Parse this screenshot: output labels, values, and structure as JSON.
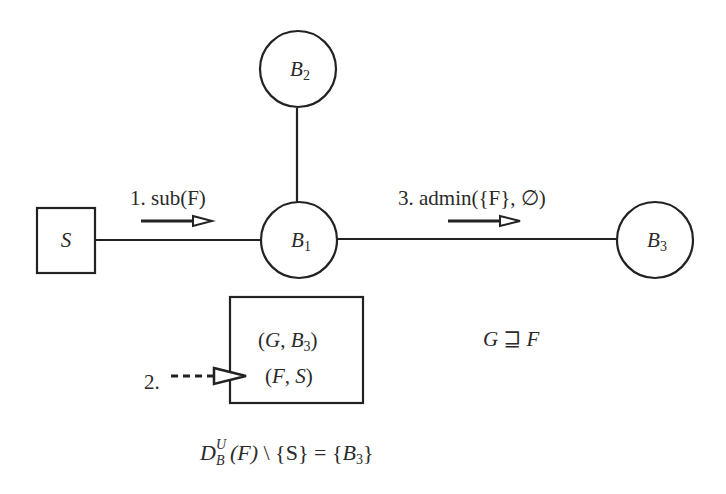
{
  "diagram": {
    "type": "network-message-flow",
    "nodes": [
      {
        "id": "S",
        "shape": "square",
        "label": "S",
        "center": [
          66,
          240
        ]
      },
      {
        "id": "B1",
        "shape": "circle",
        "label": "B",
        "subscript": "1",
        "center": [
          299,
          240
        ]
      },
      {
        "id": "B2",
        "shape": "circle",
        "label": "B",
        "subscript": "2",
        "center": [
          299,
          69
        ]
      },
      {
        "id": "B3",
        "shape": "circle",
        "label": "B",
        "subscript": "3",
        "center": [
          655,
          240
        ]
      }
    ],
    "edges": [
      {
        "from": "S",
        "to": "B1"
      },
      {
        "from": "B2",
        "to": "B1"
      },
      {
        "from": "B1",
        "to": "B3"
      }
    ],
    "messages": [
      {
        "step": "1.",
        "text": "sub(F)",
        "direction": "S→B1"
      },
      {
        "step": "2.",
        "text": "",
        "style": "dashed",
        "target": "routing-table"
      },
      {
        "step": "3.",
        "text": "admin({F}, ∅)",
        "direction": "B1→B3"
      }
    ],
    "routing_table": {
      "entries": [
        {
          "filter": "G",
          "dest": "B",
          "dest_sub": "3"
        },
        {
          "filter": "F",
          "dest": "S",
          "dest_sub": ""
        }
      ]
    },
    "relation": {
      "left": "G",
      "op": "⊒",
      "right": "F"
    },
    "equation": {
      "D": "D",
      "sup": "U",
      "sub": "B",
      "arg": "(F)",
      "minus": "\\",
      "set": "{S}",
      "eq": "=",
      "result_open": "{",
      "result": "B",
      "result_sub": "3",
      "result_close": "}"
    }
  },
  "colors": {
    "stroke": "#222222",
    "text": "#2a2a2a",
    "background": "#ffffff"
  }
}
